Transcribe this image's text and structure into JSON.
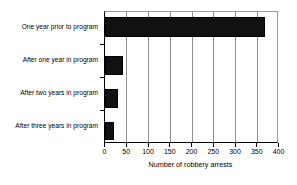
{
  "chart_data": {
    "type": "bar",
    "orientation": "horizontal",
    "title": "",
    "xlabel": "Number of robbery arrests",
    "ylabel": "",
    "categories": [
      "One year prior to program",
      "After one year in program",
      "After two years in program",
      "After three years in program"
    ],
    "values": [
      367,
      42,
      32,
      21
    ],
    "series": [
      {
        "name": "Number of robbery arrests",
        "values": [
          367,
          42,
          32,
          21
        ]
      }
    ],
    "xlim": [
      0,
      400
    ],
    "xticks": [
      0,
      50,
      100,
      150,
      200,
      250,
      300,
      350,
      400
    ],
    "xtick_labels": [
      "0",
      "50",
      "100",
      "150",
      "200",
      "250",
      "300",
      "350",
      "400"
    ],
    "grid": "vertical",
    "legend": "none",
    "bar_color": "#111111",
    "axis_color": "#000000",
    "gridline_color": "#8f8f8f",
    "background_color": "#ffffff"
  }
}
